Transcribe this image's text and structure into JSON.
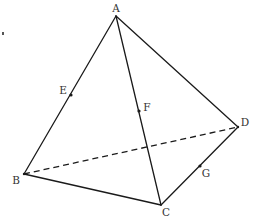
{
  "diagram": {
    "type": "tetrahedron",
    "title": "",
    "vertices": {
      "A": {
        "label": "A",
        "x": 116,
        "y": 16,
        "label_x": 116,
        "label_y": 12
      },
      "B": {
        "label": "B",
        "x": 24,
        "y": 174,
        "label_x": 16,
        "label_y": 184
      },
      "C": {
        "label": "C",
        "x": 161,
        "y": 205,
        "label_x": 166,
        "label_y": 216
      },
      "D": {
        "label": "D",
        "x": 238,
        "y": 127,
        "label_x": 245,
        "label_y": 126
      }
    },
    "points": {
      "E": {
        "label": "E",
        "on": "AB",
        "x": 71,
        "y": 95,
        "label_x": 63,
        "label_y": 94
      },
      "F": {
        "label": "F",
        "on": "AC",
        "x": 139,
        "y": 111,
        "label_x": 147,
        "label_y": 111
      },
      "G": {
        "label": "G",
        "on": "CD",
        "x": 200,
        "y": 166,
        "label_x": 206,
        "label_y": 177
      }
    },
    "edges": [
      {
        "from": "A",
        "to": "B",
        "style": "solid"
      },
      {
        "from": "A",
        "to": "C",
        "style": "solid"
      },
      {
        "from": "A",
        "to": "D",
        "style": "solid"
      },
      {
        "from": "B",
        "to": "C",
        "style": "solid"
      },
      {
        "from": "C",
        "to": "D",
        "style": "solid"
      },
      {
        "from": "B",
        "to": "D",
        "style": "dashed"
      }
    ],
    "colors": {
      "stroke": "#1a1a1a",
      "label": "#333333",
      "background": "#ffffff"
    }
  }
}
